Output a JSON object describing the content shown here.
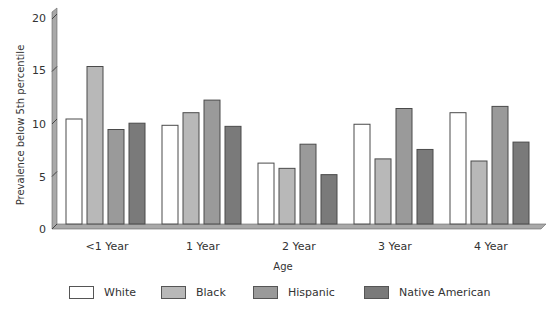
{
  "chart_data": {
    "type": "bar",
    "style": "3d-grouped",
    "title": "",
    "xlabel": "Age",
    "ylabel": "Prevalence below 5th percentile",
    "ylim": [
      0,
      20
    ],
    "yticks": [
      0,
      5,
      10,
      15,
      20
    ],
    "grid": false,
    "legend_position": "bottom",
    "categories": [
      "<1 Year",
      "1 Year",
      "2 Year",
      "3 Year",
      "4 Year"
    ],
    "series": [
      {
        "name": "White",
        "color": "#ffffff",
        "values": [
          10.0,
          9.4,
          5.8,
          9.5,
          10.6
        ]
      },
      {
        "name": "Black",
        "color": "#b8b8b8",
        "values": [
          15.0,
          10.6,
          5.3,
          6.2,
          6.0
        ]
      },
      {
        "name": "Hispanic",
        "color": "#9a9a9a",
        "values": [
          9.0,
          11.8,
          7.6,
          11.0,
          11.2
        ]
      },
      {
        "name": "Native American",
        "color": "#7a7a7a",
        "values": [
          9.6,
          9.3,
          4.7,
          7.1,
          7.8
        ]
      }
    ]
  },
  "axis": {
    "y_title": "Prevalence below 5th percentile",
    "x_title": "Age",
    "y_ticks": [
      "0",
      "5",
      "10",
      "15",
      "20"
    ],
    "categories": [
      "<1 Year",
      "1 Year",
      "2 Year",
      "3 Year",
      "4 Year"
    ]
  },
  "legend": {
    "items": [
      {
        "label": "White",
        "color": "#ffffff"
      },
      {
        "label": "Black",
        "color": "#b8b8b8"
      },
      {
        "label": "Hispanic",
        "color": "#9a9a9a"
      },
      {
        "label": "Native American",
        "color": "#7a7a7a"
      }
    ]
  },
  "colors": {
    "wall": "#a9a9a9",
    "floor": "#a9a9a9",
    "bar_border": "#4a4a4a",
    "text": "#333333"
  }
}
